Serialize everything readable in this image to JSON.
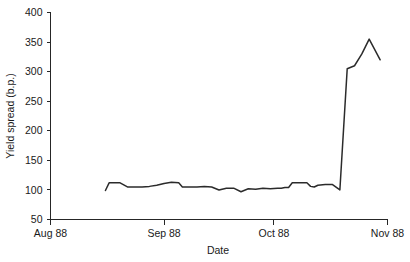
{
  "chart_data": {
    "type": "line",
    "title": "",
    "xlabel": "Date",
    "ylabel": "Yield spread (b.p.)",
    "xtick_labels": [
      "Aug 88",
      "Sep 88",
      "Oct 88",
      "Nov 88"
    ],
    "ytick_labels": [
      "50",
      "100",
      "150",
      "200",
      "250",
      "300",
      "350",
      "400"
    ],
    "ytick_values": [
      50,
      100,
      150,
      200,
      250,
      300,
      350,
      400
    ],
    "ylim": [
      50,
      400
    ],
    "xlim": [
      0,
      92
    ],
    "xtick_values": [
      0,
      31,
      61,
      92
    ],
    "grid": false,
    "legend": null,
    "series": [
      {
        "name": "Yield spread",
        "color": "#2b2b2b",
        "x": [
          15,
          16,
          17,
          19,
          21,
          23,
          25,
          27,
          29,
          31,
          33,
          35,
          36,
          38,
          40,
          42,
          44,
          46,
          48,
          50,
          52,
          54,
          56,
          58,
          60,
          62,
          63,
          64,
          65,
          66,
          68,
          70,
          71,
          72,
          73,
          75,
          77,
          79,
          81,
          83,
          85,
          87,
          90
        ],
        "y": [
          99,
          112,
          112,
          112,
          105,
          105,
          105,
          106,
          108,
          111,
          113,
          112,
          105,
          105,
          105,
          106,
          105,
          100,
          103,
          103,
          97,
          102,
          101,
          103,
          102,
          103,
          103,
          104,
          104,
          112,
          112,
          112,
          106,
          105,
          108,
          109,
          109,
          100,
          305,
          310,
          330,
          355,
          320
        ]
      }
    ],
    "annotation": "Yield spread jumps sharply from about 100 b.p. to above 300 b.p. in early October 1988, peaking near 355 b.p. before easing to about 320 b.p."
  },
  "axis": {
    "y_title": "Yield spread (b.p.)",
    "x_title": "Date"
  }
}
